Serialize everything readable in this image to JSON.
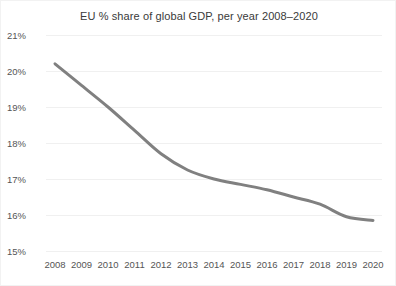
{
  "chart_data": {
    "type": "line",
    "title": "EU % share of global GDP, per year 2008–2020",
    "xlabel": "",
    "ylabel": "",
    "categories": [
      "2008",
      "2009",
      "2010",
      "2011",
      "2012",
      "2013",
      "2014",
      "2015",
      "2016",
      "2017",
      "2018",
      "2019",
      "2020"
    ],
    "x": [
      2008,
      2009,
      2010,
      2011,
      2012,
      2013,
      2014,
      2015,
      2016,
      2017,
      2018,
      2019,
      2020
    ],
    "series": [
      {
        "name": "EU % share of global GDP",
        "values": [
          20.2,
          19.6,
          19.0,
          18.35,
          17.7,
          17.25,
          17.0,
          16.85,
          16.7,
          16.5,
          16.3,
          15.95,
          15.85
        ],
        "color": "#808080"
      }
    ],
    "ylim": [
      15,
      21
    ],
    "yticks": [
      15,
      16,
      17,
      18,
      19,
      20,
      21
    ],
    "ytick_labels": [
      "15%",
      "16%",
      "17%",
      "18%",
      "19%",
      "20%",
      "21%"
    ],
    "xlim": [
      2008,
      2020
    ],
    "grid": true,
    "grid_color": "#f0f0f0",
    "legend": false,
    "legend_position": "none",
    "background": "#ffffff",
    "line_width": 3
  }
}
